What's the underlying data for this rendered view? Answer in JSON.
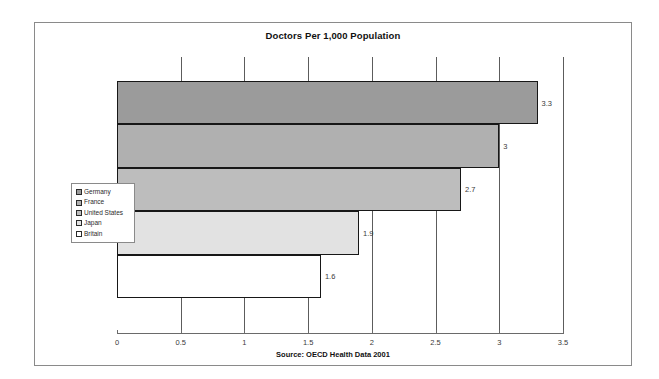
{
  "chart_data": {
    "type": "bar",
    "orientation": "horizontal",
    "title": "Doctors Per 1,000 Population",
    "xlabel": "",
    "ylabel": "",
    "xlim": [
      0,
      3.5
    ],
    "xticks": [
      "0",
      "0.5",
      "1",
      "1.5",
      "2",
      "2.5",
      "3",
      "3.5"
    ],
    "xtick_values": [
      0,
      0.5,
      1,
      1.5,
      2,
      2.5,
      3,
      3.5
    ],
    "grid": true,
    "grid_axis": "x",
    "legend_position": "left",
    "categories": [
      "Germany",
      "France",
      "United States",
      "Japan",
      "Britain"
    ],
    "values": [
      3.3,
      3,
      2.7,
      1.9,
      1.6
    ],
    "data_labels": [
      "3.3",
      "3",
      "2.7",
      "1.9",
      "1.6"
    ],
    "colors": [
      "#9b9b9b",
      "#b0b0b0",
      "#bdbdbd",
      "#e2e2e2",
      "#ffffff"
    ],
    "source": "Source: OECD Health Data 2001"
  },
  "legend": {
    "items": [
      {
        "label": "Germany",
        "color": "#9b9b9b"
      },
      {
        "label": "France",
        "color": "#b0b0b0"
      },
      {
        "label": "United States",
        "color": "#bdbdbd"
      },
      {
        "label": "Japan",
        "color": "#e2e2e2"
      },
      {
        "label": "Britain",
        "color": "#ffffff"
      }
    ]
  },
  "footer": {
    "source": "Source: OECD Health Data 2001"
  }
}
